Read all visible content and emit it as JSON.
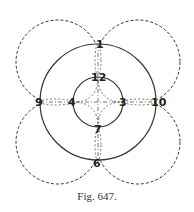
{
  "figure": {
    "caption": "Fig. 647.",
    "colors": {
      "stroke": "#333333",
      "background": "#ffffff"
    },
    "center": [
      98,
      102
    ],
    "inner_circle_radius": 25,
    "outer_circle_radius": 58,
    "dashed_circles": [
      {
        "cx": 58,
        "cy": 62,
        "r": 42
      },
      {
        "cx": 138,
        "cy": 62,
        "r": 42
      },
      {
        "cx": 58,
        "cy": 142,
        "r": 42
      },
      {
        "cx": 138,
        "cy": 142,
        "r": 42
      }
    ],
    "labels": [
      {
        "text": "1",
        "x": 98,
        "y": 48
      },
      {
        "text": "12",
        "x": 98,
        "y": 81
      },
      {
        "text": "9",
        "x": 39,
        "y": 106
      },
      {
        "text": "4",
        "x": 72,
        "y": 106
      },
      {
        "text": "3",
        "x": 122,
        "y": 106
      },
      {
        "text": "10",
        "x": 158,
        "y": 106
      },
      {
        "text": "7",
        "x": 98,
        "y": 131
      },
      {
        "text": "6",
        "x": 96,
        "y": 167
      }
    ]
  }
}
